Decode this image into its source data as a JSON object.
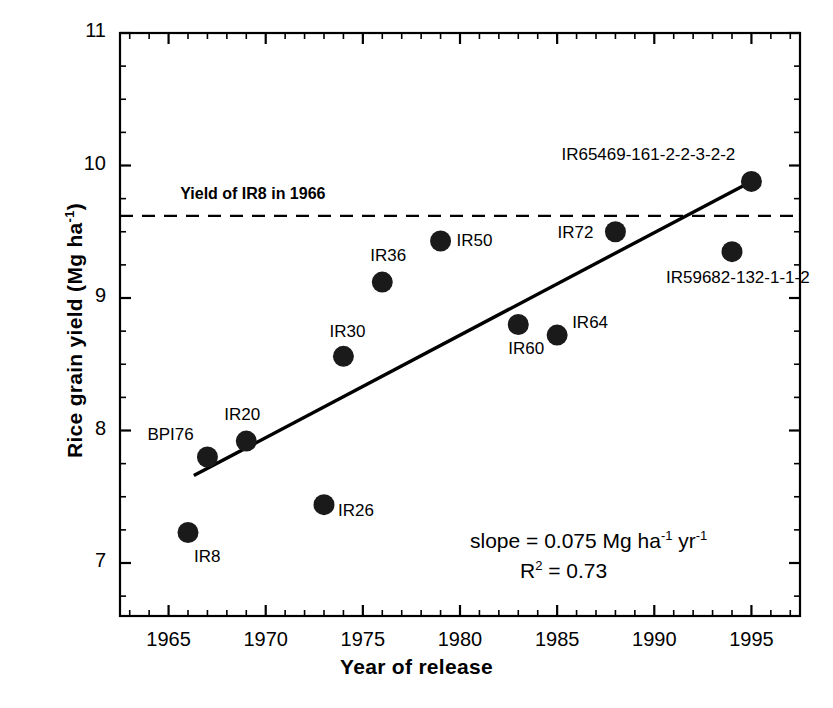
{
  "chart_data": {
    "type": "scatter",
    "title": "",
    "xlabel": "Year of release",
    "ylabel": "Rice grain yield (Mg ha-1)",
    "ylabel_base": "Rice grain yield (Mg ha",
    "ylabel_sup": "-1",
    "ylabel_tail": ")",
    "xlim": [
      1962.5,
      1997.5
    ],
    "ylim": [
      6.6,
      11.0
    ],
    "grid": false,
    "legend": "none",
    "xticks": [
      1965,
      1970,
      1975,
      1980,
      1985,
      1990,
      1995
    ],
    "xtick_labels": [
      "1965",
      "1970",
      "1975",
      "1980",
      "1985",
      "1990",
      "1995"
    ],
    "x_minor_step": 1,
    "yticks": [
      7,
      8,
      9,
      10,
      11
    ],
    "ytick_labels": [
      "7",
      "8",
      "9",
      "10",
      "11"
    ],
    "y_minor_step": 0.25,
    "points": [
      {
        "label": "IR8",
        "x": 1966,
        "y": 7.23,
        "label_dx": 6,
        "label_dy": 24
      },
      {
        "label": "BPI76",
        "x": 1967,
        "y": 7.8,
        "label_dx": -60,
        "label_dy": -22
      },
      {
        "label": "IR20",
        "x": 1969,
        "y": 7.92,
        "label_dx": -22,
        "label_dy": -26
      },
      {
        "label": "IR26",
        "x": 1973,
        "y": 7.44,
        "label_dx": 14,
        "label_dy": 6
      },
      {
        "label": "IR30",
        "x": 1974,
        "y": 8.56,
        "label_dx": -14,
        "label_dy": -24
      },
      {
        "label": "IR36",
        "x": 1976,
        "y": 9.12,
        "label_dx": -12,
        "label_dy": -26
      },
      {
        "label": "IR50",
        "x": 1979,
        "y": 9.43,
        "label_dx": 16,
        "label_dy": 0
      },
      {
        "label": "IR60",
        "x": 1983,
        "y": 8.8,
        "label_dx": -10,
        "label_dy": 24
      },
      {
        "label": "IR64",
        "x": 1985,
        "y": 8.72,
        "label_dx": 15,
        "label_dy": -12
      },
      {
        "label": "IR72",
        "x": 1988,
        "y": 9.5,
        "label_dx": -58,
        "label_dy": 1
      },
      {
        "label": "IR59682-132-1-1-2",
        "x": 1994,
        "y": 9.35,
        "label_dx": -66,
        "label_dy": 26
      },
      {
        "label": "IR65469-161-2-2-3-2-2",
        "x": 1995,
        "y": 9.88,
        "label_dx": -190,
        "label_dy": -26
      }
    ],
    "regression_line": {
      "slope": 0.075,
      "x_start": 1966.3,
      "y_start": 7.66,
      "x_end": 1995.0,
      "y_end": 9.88
    },
    "reference_line": {
      "label": "Yield of IR8 in 1966",
      "y": 9.62,
      "style": "dashed",
      "label_x": 1965.6,
      "label_y": 9.78
    },
    "annotations": {
      "slope_text": "slope  = 0.075 Mg ha",
      "slope_sup1": "-1",
      "slope_mid": " yr",
      "slope_sup2": "-1",
      "r2_text": "R",
      "r2_sup": "2",
      "r2_value": " = 0.73",
      "slope_full": "slope = 0.075 Mg ha-1 yr-1",
      "r2_full": "R2 = 0.73"
    },
    "marker_color": "#1a1a1a",
    "line_color": "#000000",
    "axis_color": "#000000"
  }
}
